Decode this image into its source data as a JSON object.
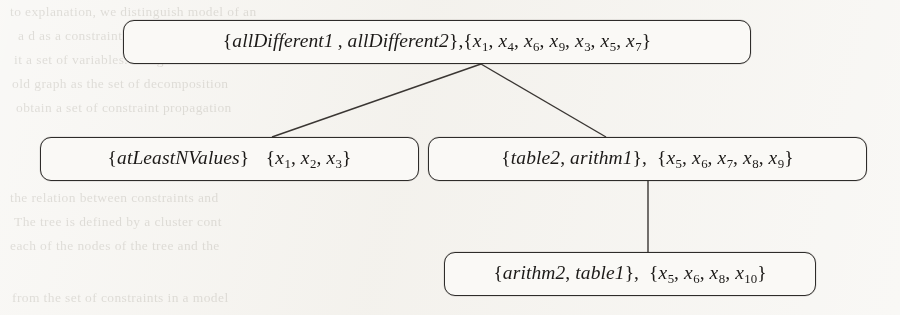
{
  "figure": {
    "kind": "tree-decomposition-diagram",
    "background_color": "#f3f1ec",
    "node_border_color": "#2e2c2a",
    "node_fill_color": "#faf9f6",
    "edge_color": "#3a3633"
  },
  "nodes": {
    "root": {
      "id": "root",
      "constraints_open": "{",
      "constraints": [
        "allDifferent1",
        "allDifferent2"
      ],
      "constraints_close": "}",
      "separator": ",",
      "variables_open": "{",
      "variables": [
        "x1",
        "x4",
        "x6",
        "x9",
        "x3",
        "x5",
        "x7"
      ],
      "variables_close": "}",
      "text": "{allDifferent1 , allDifferent2},{x1, x4, x6, x9, x3, x5, x7}"
    },
    "left": {
      "id": "left",
      "constraints_open": "{",
      "constraints": [
        "atLeastNValues"
      ],
      "constraints_close": "}",
      "separator": " ",
      "variables_open": "{",
      "variables": [
        "x1",
        "x2",
        "x3"
      ],
      "variables_close": "}",
      "text": "{atLeastNValues} {x1, x2, x3}"
    },
    "mid": {
      "id": "mid",
      "constraints_open": "{",
      "constraints": [
        "table2",
        "arithm1"
      ],
      "constraints_close": "}",
      "separator": ",",
      "variables_open": "{",
      "variables": [
        "x5",
        "x6",
        "x7",
        "x8",
        "x9"
      ],
      "variables_close": "}",
      "text": "{table2, arithm1}, {x5, x6, x7, x8, x9}"
    },
    "bottom": {
      "id": "bottom",
      "constraints_open": "{",
      "constraints": [
        "arithm2",
        "table1"
      ],
      "constraints_close": "}",
      "separator": ",",
      "variables_open": "{",
      "variables": [
        "x5",
        "x6",
        "x8",
        "x10"
      ],
      "variables_close": "}",
      "text": "{arithm2, table1}, {x5, x6, x8, x10}"
    }
  },
  "edges": [
    {
      "from": "root",
      "to": "left"
    },
    {
      "from": "root",
      "to": "mid"
    },
    {
      "from": "mid",
      "to": "bottom"
    }
  ],
  "background_text": {
    "lines": [
      "to explanation, we distinguish model of an",
      "a d as a constraint. The constraint c of a",
      "it a set of variables. Assignment of all of",
      "old graph as the set of decomposition",
      "obtain a set of constraint propagation",
      "the relation between constraints and",
      "The tree is defined by a cluster cont",
      "each of the nodes of the tree and the",
      "from the set of constraints in a model"
    ]
  }
}
